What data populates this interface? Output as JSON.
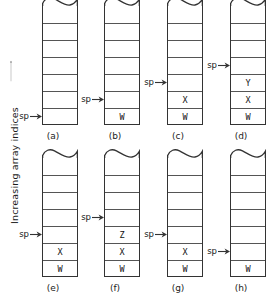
{
  "figure": {
    "axis_label": "Increasing array indices",
    "axis_arrow_direction": "up",
    "pointer_label": "sp",
    "cell_count": 7,
    "line_color": "#333333",
    "text_color": "#111111",
    "background_color": "#ffffff",
    "panels": [
      {
        "caption": "(a)",
        "sp_index": 0,
        "cells_bottom_up": [
          "",
          "",
          "",
          "",
          "",
          "",
          ""
        ]
      },
      {
        "caption": "(b)",
        "sp_index": 1,
        "cells_bottom_up": [
          "W",
          "",
          "",
          "",
          "",
          "",
          ""
        ]
      },
      {
        "caption": "(c)",
        "sp_index": 2,
        "cells_bottom_up": [
          "W",
          "X",
          "",
          "",
          "",
          "",
          ""
        ]
      },
      {
        "caption": "(d)",
        "sp_index": 3,
        "cells_bottom_up": [
          "W",
          "X",
          "Y",
          "",
          "",
          "",
          ""
        ]
      },
      {
        "caption": "(e)",
        "sp_index": 2,
        "cells_bottom_up": [
          "W",
          "X",
          "",
          "",
          "",
          "",
          ""
        ]
      },
      {
        "caption": "(f)",
        "sp_index": 3,
        "cells_bottom_up": [
          "W",
          "X",
          "Z",
          "",
          "",
          "",
          ""
        ]
      },
      {
        "caption": "(g)",
        "sp_index": 2,
        "cells_bottom_up": [
          "W",
          "X",
          "",
          "",
          "",
          "",
          ""
        ]
      },
      {
        "caption": "(h)",
        "sp_index": 1,
        "cells_bottom_up": [
          "W",
          "",
          "",
          "",
          "",
          "",
          ""
        ]
      }
    ]
  }
}
